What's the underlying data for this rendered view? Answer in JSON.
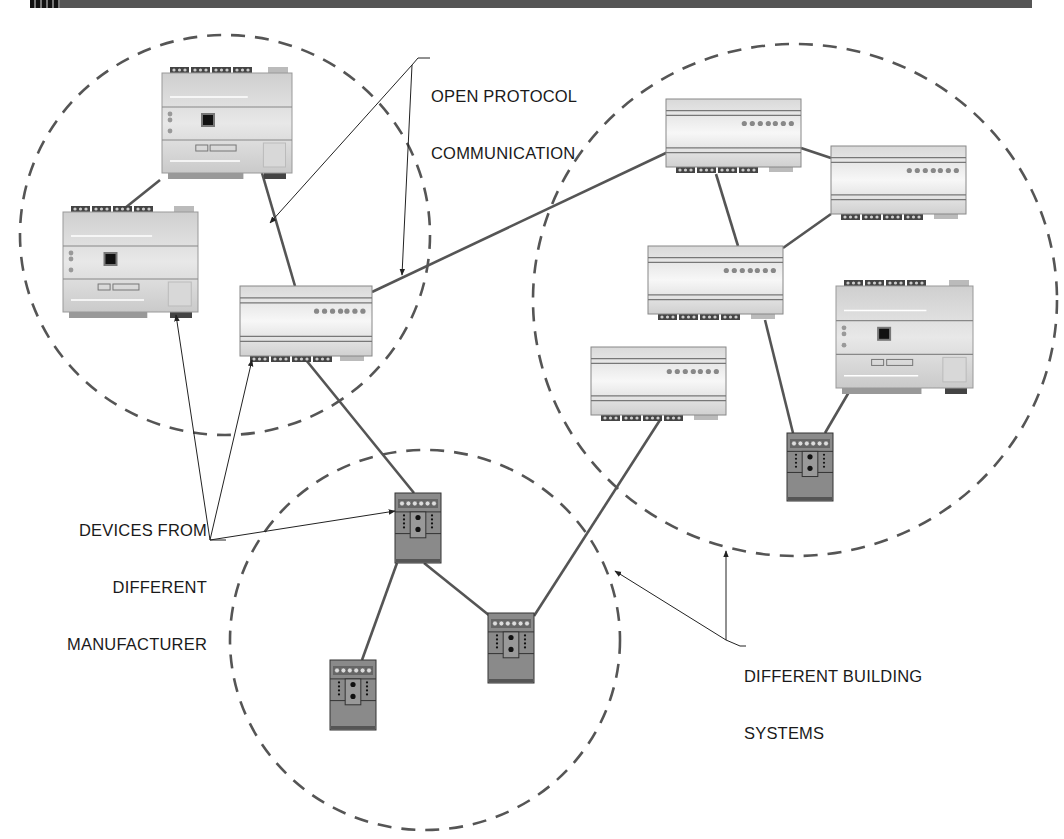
{
  "figure": {
    "header_bar": true,
    "colors": {
      "line": "#555555",
      "dash": "#555555",
      "arrow": "#222222",
      "controller_body": "#d4d4d4",
      "module_body": "#e2e2e2",
      "small_device_body": "#8a8a8a",
      "terminal_dark": "#444444"
    }
  },
  "labels": {
    "open_protocol": [
      "OPEN PROTOCOL",
      "COMMUNICATION"
    ],
    "devices": [
      "DEVICES FROM",
      "DIFFERENT",
      "MANUFACTURER"
    ],
    "building_systems": [
      "DIFFERENT BUILDING",
      "SYSTEMS"
    ]
  },
  "zones": [
    {
      "id": "zone-left",
      "cx": 225,
      "cy": 235,
      "rx": 205,
      "ry": 200
    },
    {
      "id": "zone-right",
      "cx": 795,
      "cy": 300,
      "rx": 262,
      "ry": 256
    },
    {
      "id": "zone-bottom",
      "cx": 425,
      "cy": 640,
      "rx": 195,
      "ry": 190
    }
  ],
  "devices": [
    {
      "id": "controller-top-left",
      "type": "controller",
      "x": 162,
      "y": 73,
      "w": 130,
      "h": 100
    },
    {
      "id": "controller-left",
      "type": "controller",
      "x": 63,
      "y": 212,
      "w": 135,
      "h": 100
    },
    {
      "id": "module-center",
      "type": "module",
      "x": 240,
      "y": 286,
      "w": 132,
      "h": 70
    },
    {
      "id": "module-right-top",
      "type": "module",
      "x": 666,
      "y": 99,
      "w": 135,
      "h": 68
    },
    {
      "id": "module-right-mid",
      "type": "module",
      "x": 831,
      "y": 146,
      "w": 135,
      "h": 68
    },
    {
      "id": "module-right-center",
      "type": "module",
      "x": 648,
      "y": 246,
      "w": 135,
      "h": 68
    },
    {
      "id": "module-right-low",
      "type": "module",
      "x": 591,
      "y": 347,
      "w": 135,
      "h": 68
    },
    {
      "id": "controller-right",
      "type": "controller",
      "x": 836,
      "y": 286,
      "w": 137,
      "h": 102
    },
    {
      "id": "small-device-right",
      "type": "small",
      "x": 787,
      "y": 433,
      "w": 46,
      "h": 68
    },
    {
      "id": "small-device-center",
      "type": "small",
      "x": 395,
      "y": 493,
      "w": 46,
      "h": 70
    },
    {
      "id": "small-device-bottom-mid",
      "type": "small",
      "x": 488,
      "y": 613,
      "w": 46,
      "h": 70
    },
    {
      "id": "small-device-bottom-left",
      "type": "small",
      "x": 330,
      "y": 660,
      "w": 46,
      "h": 70
    }
  ],
  "connections": [
    [
      160,
      180,
      120,
      212
    ],
    [
      262,
      173,
      295,
      286
    ],
    [
      372,
      292,
      668,
      152
    ],
    [
      801,
      148,
      831,
      158
    ],
    [
      716,
      174,
      738,
      246
    ],
    [
      783,
      248,
      831,
      214
    ],
    [
      765,
      320,
      793,
      433
    ],
    [
      856,
      380,
      825,
      433
    ],
    [
      306,
      360,
      414,
      493
    ],
    [
      397,
      563,
      362,
      660
    ],
    [
      424,
      563,
      490,
      616
    ],
    [
      534,
      616,
      660,
      420
    ]
  ],
  "arrows": [
    {
      "from": [
        412,
        65
      ],
      "to": [
        270,
        223
      ]
    },
    {
      "from": [
        412,
        65
      ],
      "to": [
        402,
        275
      ]
    },
    {
      "from": [
        210,
        540
      ],
      "to": [
        176,
        315
      ]
    },
    {
      "from": [
        210,
        540
      ],
      "to": [
        252,
        360
      ]
    },
    {
      "from": [
        210,
        540
      ],
      "to": [
        395,
        511
      ]
    },
    {
      "from": [
        726,
        640
      ],
      "to": [
        615,
        571
      ]
    },
    {
      "from": [
        726,
        640
      ],
      "to": [
        726,
        551
      ]
    }
  ]
}
